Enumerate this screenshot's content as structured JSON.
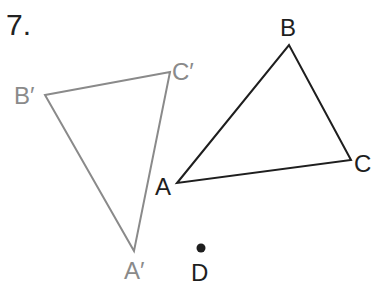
{
  "problem": {
    "number": "7."
  },
  "figure": {
    "image_triangle": {
      "color": "#8a8a8a",
      "vertices": [
        {
          "label": "A′",
          "x": 134,
          "y": 251
        },
        {
          "label": "B′",
          "x": 45,
          "y": 95
        },
        {
          "label": "C′",
          "x": 170,
          "y": 72
        }
      ]
    },
    "original_triangle": {
      "color": "#1e1e1e",
      "vertices": [
        {
          "label": "A",
          "x": 177,
          "y": 183
        },
        {
          "label": "B",
          "x": 289,
          "y": 45
        },
        {
          "label": "C",
          "x": 351,
          "y": 160
        }
      ]
    },
    "point": {
      "label": "D",
      "x": 201,
      "y": 248
    }
  },
  "labels": {
    "a_prime": "A′",
    "b_prime": "B′",
    "c_prime": "C′",
    "a": "A",
    "b": "B",
    "c": "C",
    "d": "D"
  }
}
